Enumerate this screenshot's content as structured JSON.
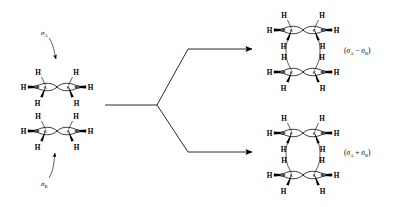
{
  "figure": {
    "background_color": "#ffffff",
    "ink_color": "#000000",
    "width": 401,
    "height": 207
  },
  "reactant": {
    "name": "two-ethylene-stack",
    "orbital_labels": [
      {
        "id": "sigma-a",
        "symbol": "σ",
        "subscript": "A",
        "x": 46,
        "y": 32,
        "arrow_to_x": 56,
        "arrow_to_y": 60
      },
      {
        "id": "sigma-b",
        "symbol": "σ",
        "subscript": "B",
        "x": 46,
        "y": 183,
        "arrow_to_x": 55,
        "arrow_to_y": 152
      }
    ],
    "units": [
      {
        "id": "ethylene-top",
        "center_x": 57,
        "center_y": 87,
        "hydrogens": [
          "H",
          "H",
          "H",
          "H",
          "H",
          "H"
        ],
        "carbons": [
          "C",
          "C"
        ]
      },
      {
        "id": "ethylene-bottom",
        "center_x": 57,
        "center_y": 131,
        "hydrogens": [
          "H",
          "H",
          "H",
          "H",
          "H",
          "H"
        ],
        "carbons": [
          "C",
          "C"
        ]
      }
    ]
  },
  "arrows": {
    "stem": {
      "x1": 105,
      "y1": 105,
      "x2": 157,
      "y2": 105
    },
    "branches": [
      {
        "id": "arrow-to-antisymmetric",
        "vertex_x": 157,
        "vertex_y": 105,
        "elbow_x": 188,
        "elbow_y": 49,
        "tip_x": 256,
        "tip_y": 49
      },
      {
        "id": "arrow-to-symmetric",
        "vertex_x": 157,
        "vertex_y": 105,
        "elbow_x": 188,
        "elbow_y": 152,
        "tip_x": 256,
        "tip_y": 152
      }
    ]
  },
  "products": [
    {
      "id": "antisymmetric-combination",
      "label": "(σ",
      "label_full": "(σA − σB)",
      "operator": "−",
      "sub_a": "A",
      "sub_b": "B",
      "sigma": "σ",
      "open_paren": "(",
      "close_paren": ")",
      "label_x": 344,
      "label_y": 51,
      "units": [
        {
          "id": "product1-ethylene-top",
          "center_x": 303,
          "center_y": 30,
          "hydrogens": [
            "H",
            "H",
            "H",
            "H",
            "H",
            "H"
          ],
          "carbons": [
            "C",
            "C"
          ]
        },
        {
          "id": "product1-ethylene-bottom",
          "center_x": 303,
          "center_y": 72,
          "hydrogens": [
            "H",
            "H",
            "H",
            "H",
            "H",
            "H"
          ],
          "carbons": [
            "C",
            "C"
          ]
        }
      ]
    },
    {
      "id": "symmetric-combination",
      "label_full": "(σA + σB)",
      "operator": "+",
      "sub_a": "A",
      "sub_b": "B",
      "sigma": "σ",
      "open_paren": "(",
      "close_paren": ")",
      "label_x": 344,
      "label_y": 153,
      "units": [
        {
          "id": "product2-ethylene-top",
          "center_x": 303,
          "center_y": 133,
          "hydrogens": [
            "H",
            "H",
            "H",
            "H",
            "H",
            "H"
          ],
          "carbons": [
            "C",
            "C"
          ]
        },
        {
          "id": "product2-ethylene-bottom",
          "center_x": 303,
          "center_y": 175,
          "hydrogens": [
            "H",
            "H",
            "H",
            "H",
            "H",
            "H"
          ],
          "carbons": [
            "C",
            "C"
          ]
        }
      ]
    }
  ],
  "atom_text": {
    "hydrogen": "H",
    "carbon": "C"
  }
}
